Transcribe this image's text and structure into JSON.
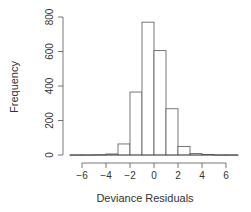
{
  "chart_data": {
    "type": "bar",
    "title": "",
    "xlabel": "Deviance Residuals",
    "ylabel": "Frequency",
    "bin_edges": [
      -7,
      -6,
      -5,
      -4,
      -3,
      -2,
      -1,
      0,
      1,
      2,
      3,
      4,
      5,
      6,
      7
    ],
    "values": [
      1,
      1,
      2,
      6,
      64,
      365,
      770,
      605,
      268,
      50,
      8,
      3,
      1,
      1
    ],
    "xlim": [
      -7,
      7
    ],
    "ylim": [
      0,
      800
    ],
    "xticks": [
      -6,
      -4,
      -2,
      0,
      2,
      4,
      6
    ],
    "xtick_labels": [
      "−6",
      "−4",
      "−2",
      "0",
      "2",
      "4",
      "6"
    ],
    "yticks": [
      0,
      200,
      400,
      600,
      800
    ],
    "ytick_labels": [
      "0",
      "200",
      "400",
      "600",
      "800"
    ],
    "grid": false,
    "colors": {
      "bar_fill": "#ffffff",
      "bar_stroke": "#555555",
      "axis": "#555555"
    }
  }
}
